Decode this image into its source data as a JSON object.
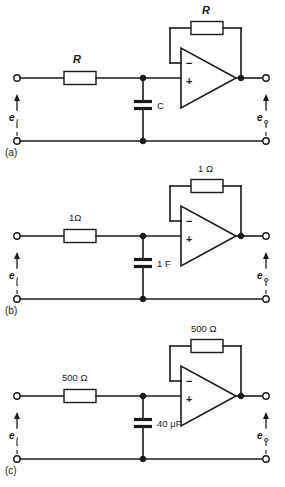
{
  "figure": {
    "panel_count": 3,
    "background_color": "#ffffff",
    "line_color": "#1a1a1a"
  },
  "panels": [
    {
      "tag": "(a)",
      "id": "panel-a",
      "input_label": "e",
      "input_subscript": "i",
      "output_label": "e",
      "output_subscript": "o",
      "series_resistor": "R",
      "series_resistor_italic": true,
      "shunt_capacitor": "C",
      "feedback_resistor": "R",
      "feedback_resistor_italic": true,
      "opamp_minus": "−",
      "opamp_plus": "+"
    },
    {
      "tag": "(b)",
      "id": "panel-b",
      "input_label": "e",
      "input_subscript": "i",
      "output_label": "e",
      "output_subscript": "o",
      "series_resistor": "1Ω",
      "series_resistor_italic": false,
      "shunt_capacitor": "1 F",
      "feedback_resistor": "1 Ω",
      "feedback_resistor_italic": false,
      "opamp_minus": "−",
      "opamp_plus": "+"
    },
    {
      "tag": "(c)",
      "id": "panel-c",
      "input_label": "e",
      "input_subscript": "i",
      "output_label": "e",
      "output_subscript": "o",
      "series_resistor": "500 Ω",
      "series_resistor_italic": false,
      "shunt_capacitor": "40 μF",
      "feedback_resistor": "500 Ω",
      "feedback_resistor_italic": false,
      "opamp_minus": "−",
      "opamp_plus": "+"
    }
  ]
}
